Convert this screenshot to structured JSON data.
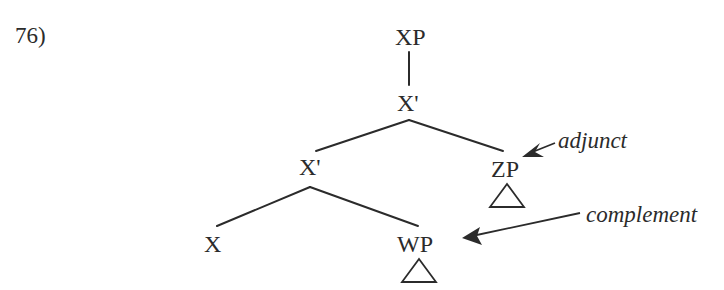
{
  "example_number": "76)",
  "tree": {
    "root": "XP",
    "bar_top": "X'",
    "bar_mid": "X'",
    "adjunct_node": "ZP",
    "head": "X",
    "complement_node": "WP"
  },
  "annotations": {
    "adjunct": "adjunct",
    "complement": "complement"
  },
  "colors": {
    "ink": "#2b2b2b",
    "background": "#ffffff"
  }
}
